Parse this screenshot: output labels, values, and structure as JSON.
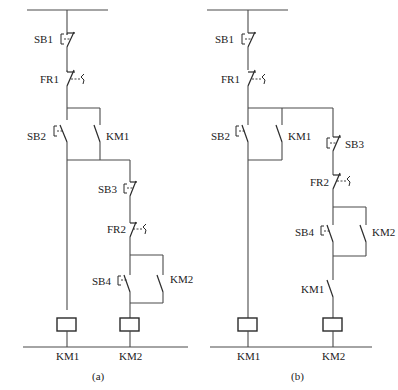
{
  "figure": {
    "colors": {
      "line": "#4a4a4a",
      "text": "#222222",
      "background": "#ffffff"
    }
  },
  "diagram_a": {
    "caption": "(a)",
    "labels": {
      "sb1": "SB1",
      "fr1": "FR1",
      "sb2": "SB2",
      "km1_contact": "KM1",
      "sb3": "SB3",
      "fr2": "FR2",
      "sb4": "SB4",
      "km2_contact": "KM2",
      "coil_km1": "KM1",
      "coil_km2": "KM2"
    }
  },
  "diagram_b": {
    "caption": "(b)",
    "labels": {
      "sb1": "SB1",
      "fr1": "FR1",
      "sb2": "SB2",
      "km1_contact": "KM1",
      "sb3": "SB3",
      "fr2": "FR2",
      "sb4": "SB4",
      "km2_contact": "KM2",
      "km1_interlock": "KM1",
      "coil_km1": "KM1",
      "coil_km2": "KM2"
    }
  }
}
